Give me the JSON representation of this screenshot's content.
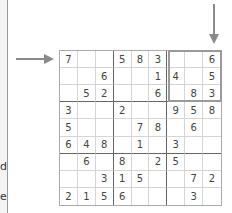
{
  "sidebar": {
    "text_fragments": [
      "d",
      "e"
    ]
  },
  "puzzle": {
    "type": "sudoku",
    "highlight": {
      "box_row": 0,
      "box_col": 2
    },
    "row_arrow_index": 0,
    "col_arrow_index": 8,
    "grid": [
      [
        "7",
        "",
        "",
        "5",
        "8",
        "3",
        "",
        "",
        "6"
      ],
      [
        "",
        "",
        "6",
        "",
        "",
        "1",
        "4",
        "",
        "5"
      ],
      [
        "",
        "5",
        "2",
        "",
        "",
        "6",
        "",
        "8",
        "3"
      ],
      [
        "3",
        "",
        "",
        "2",
        "",
        "",
        "9",
        "5",
        "8"
      ],
      [
        "5",
        "",
        "",
        "",
        "7",
        "8",
        "",
        "6",
        ""
      ],
      [
        "6",
        "4",
        "8",
        "",
        "1",
        "",
        "3",
        "",
        ""
      ],
      [
        "",
        "6",
        "",
        "8",
        "",
        "2",
        "5",
        "",
        ""
      ],
      [
        "",
        "",
        "3",
        "1",
        "5",
        "",
        "",
        "7",
        "2"
      ],
      [
        "2",
        "1",
        "5",
        "6",
        "",
        "",
        "",
        "3",
        ""
      ]
    ]
  }
}
